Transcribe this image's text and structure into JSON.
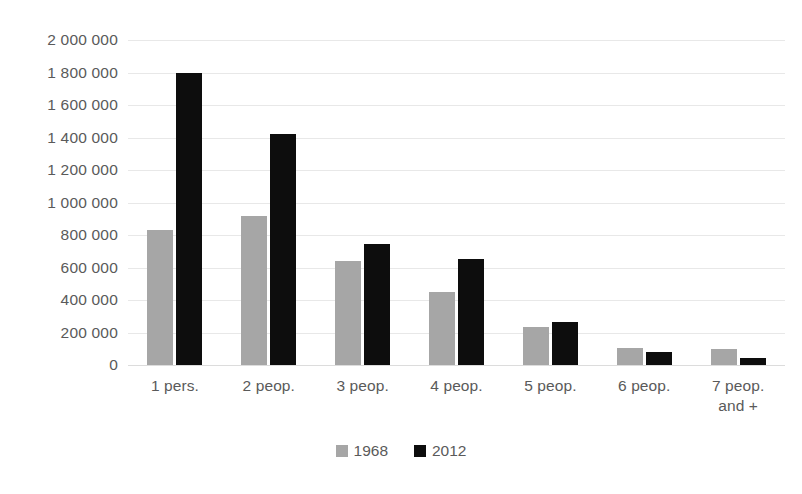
{
  "chart_data": {
    "type": "bar",
    "title": "",
    "subtitle": "",
    "xlabel": "",
    "ylabel": "",
    "ylim": [
      0,
      2000000
    ],
    "ytick_step": 200000,
    "grid": true,
    "legend_position": "bottom",
    "categories": [
      "1 pers.",
      "2 peop.",
      "3 peop.",
      "4 peop.",
      "5 peop.",
      "6 peop.",
      "7 peop. and +"
    ],
    "category_lines": [
      [
        "1 pers."
      ],
      [
        "2 peop."
      ],
      [
        "3 peop."
      ],
      [
        "4 peop."
      ],
      [
        "5 peop."
      ],
      [
        "6 peop."
      ],
      [
        "7 peop.",
        "and +"
      ]
    ],
    "ytick_labels": [
      "2 000 000",
      "1 800 000",
      "1 600 000",
      "1 400 000",
      "1 200 000",
      "1 000 000",
      "800 000",
      "600 000",
      "400 000",
      "200 000",
      "0"
    ],
    "ytick_values": [
      2000000,
      1800000,
      1600000,
      1400000,
      1200000,
      1000000,
      800000,
      600000,
      400000,
      200000,
      0
    ],
    "series": [
      {
        "name": "1968",
        "color": "#a6a6a6",
        "values": [
          830000,
          920000,
          640000,
          450000,
          235000,
          105000,
          100000
        ]
      },
      {
        "name": "2012",
        "color": "#0d0d0d",
        "values": [
          1795000,
          1420000,
          745000,
          650000,
          265000,
          80000,
          45000
        ]
      }
    ]
  },
  "legend": {
    "items": [
      {
        "label": "1968",
        "color": "#a6a6a6"
      },
      {
        "label": "2012",
        "color": "#0d0d0d"
      }
    ]
  },
  "colors": {
    "series_1968": "#a6a6a6",
    "series_2012": "#0d0d0d",
    "gridline": "#e8e8e8",
    "text": "#5a5a5a",
    "background": "#ffffff"
  }
}
